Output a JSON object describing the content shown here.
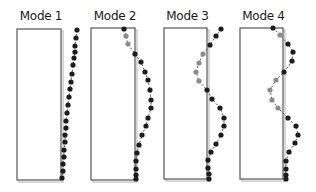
{
  "figure": {
    "panels": [
      {
        "title": "Mode 1",
        "box": {
          "x": 17,
          "y": 29,
          "w": 44,
          "h": 151
        },
        "dots_black": [
          [
            77,
            30
          ],
          [
            76,
            38
          ],
          [
            75,
            46
          ],
          [
            75,
            52
          ],
          [
            74,
            58
          ],
          [
            73,
            65
          ],
          [
            72,
            74
          ],
          [
            71,
            82
          ],
          [
            70,
            89
          ],
          [
            69,
            97
          ],
          [
            68,
            105
          ],
          [
            67,
            113
          ],
          [
            66,
            121
          ],
          [
            66,
            128
          ],
          [
            65,
            135
          ],
          [
            65,
            142
          ],
          [
            64,
            150
          ],
          [
            64,
            157
          ],
          [
            63,
            164
          ],
          [
            63,
            171
          ],
          [
            62,
            178
          ]
        ],
        "dots_gray": []
      },
      {
        "title": "Mode 2",
        "box": {
          "x": 91,
          "y": 28,
          "w": 44,
          "h": 152
        },
        "dots_black": [
          [
            124,
            29
          ],
          [
            135,
            54
          ],
          [
            141,
            62
          ],
          [
            145,
            72
          ],
          [
            148,
            80
          ],
          [
            150,
            90
          ],
          [
            151,
            100
          ],
          [
            151,
            108
          ],
          [
            148,
            118
          ],
          [
            146,
            126
          ],
          [
            142,
            135
          ],
          [
            139,
            145
          ],
          [
            137,
            153
          ],
          [
            136,
            161
          ],
          [
            136,
            169
          ],
          [
            136,
            175
          ],
          [
            136,
            179
          ]
        ],
        "dots_gray": [
          [
            126,
            36
          ],
          [
            128,
            44
          ]
        ]
      },
      {
        "title": "Mode 3",
        "box": {
          "x": 164,
          "y": 28,
          "w": 43,
          "h": 151
        },
        "dots_black": [
          [
            221,
            29
          ],
          [
            216,
            36
          ],
          [
            210,
            45
          ],
          [
            207,
            90
          ],
          [
            212,
            99
          ],
          [
            220,
            108
          ],
          [
            224,
            118
          ],
          [
            224,
            126
          ],
          [
            221,
            135
          ],
          [
            216,
            144
          ],
          [
            211,
            152
          ],
          [
            208,
            160
          ],
          [
            208,
            168
          ],
          [
            209,
            174
          ],
          [
            209,
            179
          ]
        ],
        "dots_gray": [
          [
            203,
            54
          ],
          [
            199,
            63
          ],
          [
            196,
            72
          ],
          [
            199,
            81
          ]
        ],
        "gray_link": [
          [
            203,
            54
          ],
          [
            199,
            81
          ]
        ]
      },
      {
        "title": "Mode 4",
        "box": {
          "x": 240,
          "y": 28,
          "w": 43,
          "h": 151
        },
        "dots_black": [
          [
            273,
            28
          ],
          [
            288,
            44
          ],
          [
            293,
            52
          ],
          [
            292,
            61
          ],
          [
            284,
            72
          ],
          [
            288,
            118
          ],
          [
            296,
            126
          ],
          [
            298,
            135
          ],
          [
            295,
            143
          ],
          [
            289,
            152
          ],
          [
            286,
            161
          ],
          [
            286,
            169
          ],
          [
            286,
            175
          ],
          [
            286,
            179
          ]
        ],
        "dots_gray": [
          [
            280,
            35
          ],
          [
            276,
            80
          ],
          [
            270,
            90
          ],
          [
            272,
            100
          ],
          [
            278,
            108
          ]
        ]
      }
    ]
  },
  "colors": {
    "box_stroke": "#555555",
    "box_shadow": "#bdbdbd",
    "dot_black": "#1c1c1c",
    "dot_gray": "#8c8c8c",
    "link": "#5a5a5a"
  }
}
